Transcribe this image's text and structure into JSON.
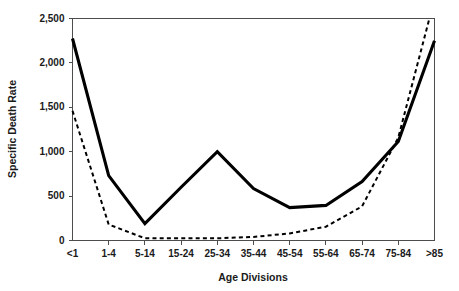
{
  "chart_data": {
    "type": "line",
    "title": "",
    "xlabel": "Age Divisions",
    "ylabel": "Specific Death Rate",
    "categories": [
      "<1",
      "1-4",
      "5-14",
      "15-24",
      "25-34",
      "35-44",
      "45-54",
      "55-64",
      "65-74",
      "75-84",
      ">85"
    ],
    "ylim": [
      0,
      2500
    ],
    "yticks": [
      0,
      500,
      1000,
      1500,
      2000,
      2500
    ],
    "ytick_labels": [
      "0",
      "500",
      "1,000",
      "1,500",
      "2,000",
      "2,500"
    ],
    "grid": false,
    "legend": "none",
    "series": [
      {
        "name": "solid-series",
        "style": "solid",
        "color": "#000000",
        "values": [
          2275,
          730,
          190,
          600,
          1000,
          585,
          370,
          395,
          665,
          1115,
          2250
        ]
      },
      {
        "name": "dashed-series",
        "style": "dashed",
        "color": "#000000",
        "values": [
          1460,
          180,
          25,
          25,
          25,
          40,
          80,
          155,
          385,
          1160,
          2720
        ]
      }
    ]
  },
  "labels": {
    "y_axis_title": "Specific Death Rate",
    "x_axis_title": "Age Divisions"
  }
}
